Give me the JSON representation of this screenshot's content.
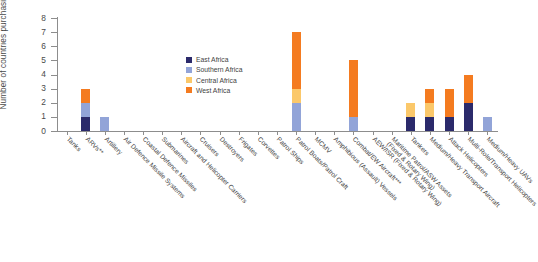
{
  "chart_data": {
    "type": "bar",
    "title": "",
    "subtitle": "",
    "xlabel": "",
    "ylabel": "Number of countries\npurchasing",
    "ylim": [
      0,
      8
    ],
    "ytick_labels": [
      "0",
      "1",
      "2",
      "3",
      "4",
      "5",
      "6",
      "7",
      "8"
    ],
    "yticks": [
      0,
      1,
      2,
      3,
      4,
      5,
      6,
      7,
      8
    ],
    "grid": false,
    "stacked": true,
    "legend_position": "inside-upper-center",
    "categories": [
      "Tanks",
      "ARVs**",
      "Artillery",
      "Air Defence Missile Systems",
      "Coastal Defence Missiles",
      "Submarines",
      "Aircraft and Helicopter Carriers",
      "Cruisers",
      "Destroyers",
      "Frigates",
      "Corvettes",
      "Patrol Ships",
      "Patrol Boats/Patrol Craft",
      "MCMV",
      "Amphibious (Assault) Vessels",
      "Combat/EW Aircraft***",
      "AEW/ISR (Fixed & Rotary Wing)",
      "Maritime Patrol/ASW Assets\n(Fixed & Rotary Wing)",
      "Tankers",
      "Medium/Heavy Transport Aircraft",
      "Attack Helicopters",
      "Multi-Role/Transport Helicopters",
      "Medium/Heavy UAVs"
    ],
    "series": [
      {
        "name": "East Africa",
        "color": "#2b2a6b",
        "values": [
          0,
          1,
          0,
          0,
          0,
          0,
          0,
          0,
          0,
          0,
          0,
          0,
          0,
          0,
          0,
          0,
          0,
          0,
          1,
          1,
          1,
          2,
          0
        ]
      },
      {
        "name": "Southern Africa",
        "color": "#92a4d8",
        "values": [
          0,
          1,
          1,
          0,
          0,
          0,
          0,
          0,
          0,
          0,
          0,
          0,
          2,
          0,
          0,
          1,
          0,
          0,
          0,
          0,
          0,
          0,
          1
        ]
      },
      {
        "name": "Central Africa",
        "color": "#fbc86a",
        "values": [
          0,
          0,
          0,
          0,
          0,
          0,
          0,
          0,
          0,
          0,
          0,
          0,
          1,
          0,
          0,
          0,
          0,
          0,
          1,
          1,
          0,
          0,
          0
        ]
      },
      {
        "name": "West Africa",
        "color": "#f47b20",
        "values": [
          0,
          1,
          0,
          0,
          0,
          0,
          0,
          0,
          0,
          0,
          0,
          0,
          4,
          0,
          0,
          4,
          0,
          0,
          0,
          1,
          2,
          2,
          0
        ]
      }
    ],
    "totals": [
      0,
      3,
      1,
      0,
      0,
      0,
      0,
      0,
      0,
      0,
      0,
      0,
      7,
      0,
      0,
      5,
      0,
      0,
      2,
      3,
      3,
      4,
      1
    ]
  },
  "legend": {
    "items": [
      {
        "label": "East Africa",
        "color": "#2b2a6b"
      },
      {
        "label": "Southern Africa",
        "color": "#92a4d8"
      },
      {
        "label": "Central Africa",
        "color": "#fbc86a"
      },
      {
        "label": "West Africa",
        "color": "#f47b20"
      }
    ]
  },
  "footnote": {
    "text": ""
  }
}
